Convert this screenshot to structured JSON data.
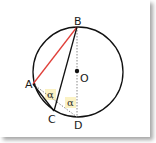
{
  "figure": {
    "points": {
      "A": {
        "label": "A"
      },
      "B": {
        "label": "B"
      },
      "C": {
        "label": "C"
      },
      "D": {
        "label": "D"
      },
      "O": {
        "label": "O"
      }
    },
    "angles": [
      {
        "label": "α",
        "at": "A"
      },
      {
        "label": "α",
        "at": "D"
      }
    ],
    "colors": {
      "chord_AB": "#e0403a",
      "lines": "#111111",
      "dotted": "#888888",
      "angle_highlight": "#fbf2c4"
    }
  }
}
